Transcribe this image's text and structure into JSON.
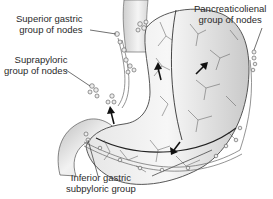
{
  "diagram": {
    "labels": {
      "superior_gastric": {
        "line1": "Superior gastric",
        "line2": "group of nodes"
      },
      "suprapyloric": {
        "line1": "Suprapyloric",
        "line2": "group of nodes"
      },
      "pancreaticolienal": {
        "line1": "Pancreaticolienal",
        "line2": "group of nodes"
      },
      "inferior_gastric": {
        "line1": "Inferior gastric",
        "line2": "subpyloric group"
      }
    },
    "colors": {
      "outline": "#333333",
      "fill_light": "#f2f2f2",
      "fill_dark": "#c8c8c8",
      "text": "#2a2a2a"
    }
  }
}
